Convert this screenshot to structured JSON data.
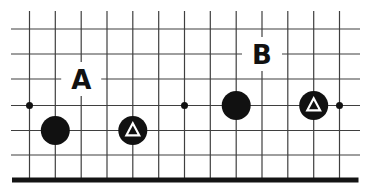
{
  "diagram": {
    "kind": "go-board-edge-diagram",
    "canvas": {
      "width": 365,
      "height": 193
    },
    "colors": {
      "background": "#ffffff",
      "grid_line": "#3f3f3f",
      "board_edge": "#141414",
      "stone": "#111111",
      "marker": "#ffffff",
      "label": "#111111"
    },
    "grid": {
      "cols_x": [
        29.5,
        55.3,
        81.2,
        107.0,
        132.8,
        158.7,
        184.5,
        210.3,
        236.2,
        262.0,
        287.8,
        313.7,
        339.5
      ],
      "rows_y": [
        29,
        54,
        79,
        105.5,
        130.5,
        155
      ],
      "edge_y": 180,
      "edge_x1": 12,
      "edge_x2": 358.5,
      "edge_thickness": 5,
      "line_thickness": 1.2,
      "verticals_top_y": 11,
      "horizontals_left_x": 11,
      "horizontals_right_x": 360
    },
    "star_points": [
      {
        "col": 1,
        "row": 4
      },
      {
        "col": 7,
        "row": 4
      },
      {
        "col": 13,
        "row": 4
      }
    ],
    "star_point_radius": 3.5,
    "stones": [
      {
        "col": 2,
        "row": 5,
        "color": "black",
        "marker": "none"
      },
      {
        "col": 5,
        "row": 5,
        "color": "black",
        "marker": "triangle"
      },
      {
        "col": 9,
        "row": 4,
        "color": "black",
        "marker": "none"
      },
      {
        "col": 12,
        "row": 4,
        "color": "black",
        "marker": "triangle"
      }
    ],
    "stone_radius": 14.5,
    "triangle": {
      "half_width": 6.4,
      "apex_dy": -7.2,
      "base_dy": 4.8,
      "stroke_width": 2.2
    },
    "labels": [
      {
        "text": "A",
        "col": 3,
        "row": 3
      },
      {
        "text": "B",
        "col": 10,
        "row": 2
      }
    ],
    "label_mask": {
      "width": 40,
      "height": 34
    }
  }
}
